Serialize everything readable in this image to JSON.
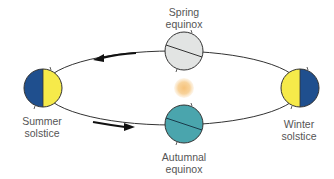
{
  "diagram": {
    "colors": {
      "orbit": "#333333",
      "day_side": "#f6ea4a",
      "night_side": "#1f4f8e",
      "spring_globe": "#e2e4e3",
      "autumn_globe": "#4aa5ad",
      "sun": "#f7cf92",
      "label": "#555555"
    },
    "positions": [
      {
        "id": "summer",
        "line1": "Summer",
        "line2": "solstice"
      },
      {
        "id": "spring",
        "line1": "Spring",
        "line2": "equinox"
      },
      {
        "id": "winter",
        "line1": "Winter",
        "line2": "solstice"
      },
      {
        "id": "autumn",
        "line1": "Autumnal",
        "line2": "equinox"
      }
    ],
    "arrows": [
      {
        "id": "top-arrow",
        "direction": "left"
      },
      {
        "id": "bottom-arrow",
        "direction": "right"
      }
    ]
  }
}
